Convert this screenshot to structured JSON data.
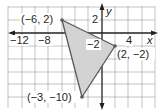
{
  "graph": {
    "axes": {
      "x_label": "x",
      "y_label": "y"
    },
    "x_ticks": [
      {
        "value": -12,
        "label": "−12"
      },
      {
        "value": -8,
        "label": "−8"
      },
      {
        "value": 4,
        "label": "4"
      }
    ],
    "y_ticks": [
      {
        "value": 2,
        "label": "2"
      },
      {
        "value": -2,
        "label": "−2"
      }
    ],
    "grid_step": 2,
    "x_range": [
      -14,
      8
    ],
    "y_range": [
      -11.5,
      4
    ],
    "triangle": {
      "fill": "#d3d3d3",
      "stroke": "#58595b",
      "vertices": [
        {
          "x": -6,
          "y": 2,
          "label": "(−6, 2)"
        },
        {
          "x": 2,
          "y": -2,
          "label": "(2, −2)"
        },
        {
          "x": -3,
          "y": -10,
          "label": "(−3, −10)"
        }
      ]
    }
  }
}
